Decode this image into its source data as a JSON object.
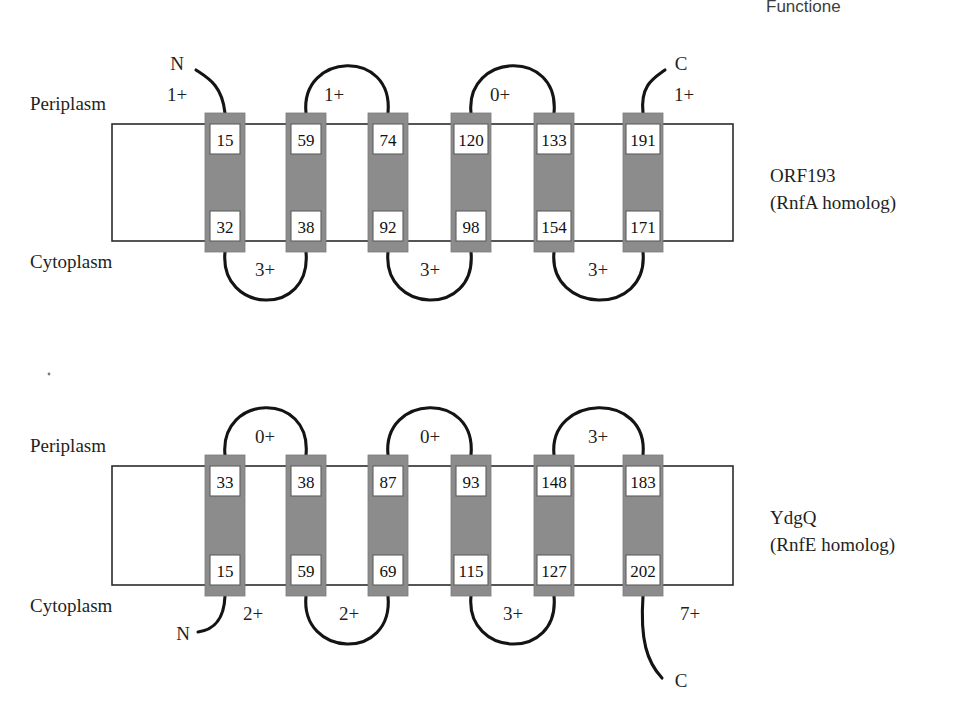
{
  "page": {
    "cropped_header_text": "Functione",
    "background": "#ffffff",
    "ink_color": "#141414",
    "helix_fill": "#8a8a8a"
  },
  "labels": {
    "periplasm": "Periplasm",
    "cytoplasm": "Cytoplasm",
    "n_terminus": "N",
    "c_terminus": "C"
  },
  "diagrams": [
    {
      "id": "orf193",
      "name_line1": "ORF193",
      "name_line2": "(RnfA homolog)",
      "periplasm_label": "Periplasm",
      "cytoplasm_label": "Cytoplasm",
      "n_terminus_side": "periplasm",
      "c_terminus_side": "periplasm",
      "n_terminus_label": "N",
      "c_terminus_label": "C",
      "n_terminus_charge": "1+",
      "c_terminus_charge": "1+",
      "helices": [
        {
          "index": 1,
          "top_residue": "15",
          "bottom_residue": "32"
        },
        {
          "index": 2,
          "top_residue": "59",
          "bottom_residue": "38"
        },
        {
          "index": 3,
          "top_residue": "74",
          "bottom_residue": "92"
        },
        {
          "index": 4,
          "top_residue": "120",
          "bottom_residue": "98"
        },
        {
          "index": 5,
          "top_residue": "133",
          "bottom_residue": "154"
        },
        {
          "index": 6,
          "top_residue": "191",
          "bottom_residue": "171"
        }
      ],
      "periplasmic_loops": [
        {
          "between": [
            2,
            3
          ],
          "charge": "1+"
        },
        {
          "between": [
            4,
            5
          ],
          "charge": "0+"
        }
      ],
      "cytoplasmic_loops": [
        {
          "between": [
            1,
            2
          ],
          "charge": "3+"
        },
        {
          "between": [
            3,
            4
          ],
          "charge": "3+"
        },
        {
          "between": [
            5,
            6
          ],
          "charge": "3+"
        }
      ]
    },
    {
      "id": "ydgq",
      "name_line1": "YdgQ",
      "name_line2": "(RnfE homolog)",
      "periplasm_label": "Periplasm",
      "cytoplasm_label": "Cytoplasm",
      "n_terminus_side": "cytoplasm",
      "c_terminus_side": "cytoplasm",
      "n_terminus_label": "N",
      "c_terminus_label": "C",
      "n_terminus_charge": "2+",
      "c_terminus_charge": "7+",
      "helices": [
        {
          "index": 1,
          "top_residue": "33",
          "bottom_residue": "15"
        },
        {
          "index": 2,
          "top_residue": "38",
          "bottom_residue": "59"
        },
        {
          "index": 3,
          "top_residue": "87",
          "bottom_residue": "69"
        },
        {
          "index": 4,
          "top_residue": "93",
          "bottom_residue": "115"
        },
        {
          "index": 5,
          "top_residue": "148",
          "bottom_residue": "127"
        },
        {
          "index": 6,
          "top_residue": "183",
          "bottom_residue": "202"
        }
      ],
      "periplasmic_loops": [
        {
          "between": [
            1,
            2
          ],
          "charge": "0+"
        },
        {
          "between": [
            3,
            4
          ],
          "charge": "0+"
        },
        {
          "between": [
            5,
            6
          ],
          "charge": "3+"
        }
      ],
      "cytoplasmic_loops": [
        {
          "between": [
            2,
            3
          ],
          "charge": "2+"
        },
        {
          "between": [
            4,
            5
          ],
          "charge": "3+"
        }
      ]
    }
  ],
  "geometry": {
    "helix_centers_x": [
      225,
      306,
      388,
      471,
      554,
      643
    ],
    "helix_width": 40,
    "membrane_left_x": 112,
    "membrane_right_x": 733,
    "top_diagram": {
      "membrane_top_y": 124,
      "membrane_bottom_y": 241
    },
    "bottom_diagram": {
      "membrane_top_y": 466,
      "membrane_bottom_y": 585
    }
  }
}
